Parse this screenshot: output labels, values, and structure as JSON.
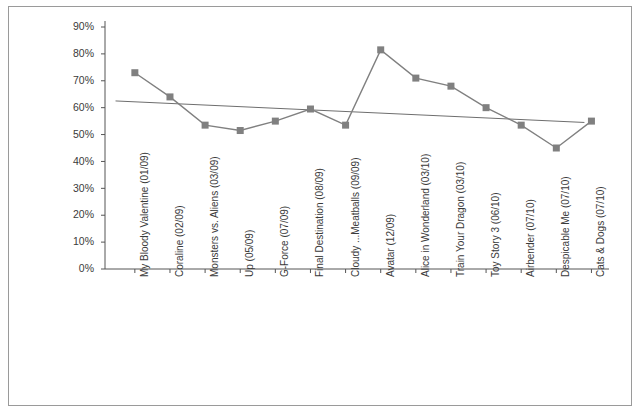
{
  "figure": {
    "border_color": "#9a9a9a",
    "background": "#ffffff"
  },
  "chart_data": {
    "type": "line",
    "title": "",
    "subtitle": "",
    "xlabel": "",
    "ylabel": "",
    "ylim": [
      0,
      90
    ],
    "ytick_labels": [
      "90%",
      "80%",
      "70%",
      "60%",
      "50%",
      "40%",
      "30%",
      "20%",
      "10%",
      "0%"
    ],
    "ytick_values": [
      90,
      80,
      70,
      60,
      50,
      40,
      30,
      20,
      10,
      0
    ],
    "grid": false,
    "legend": "none",
    "marker": "square",
    "series_color": "#808080",
    "trendline_color": "#6e6e6e",
    "categories": [
      "My Bloody Valentine (01/09)",
      "Coraline (02/09)",
      "Monsters vs. Aliens (03/09)",
      "Up (05/09)",
      "G-Force (07/09)",
      "Final Destination (08/09)",
      "Cloudy ...Meatballs (09/09)",
      "Avatar (12/09)",
      "Alice in Wonderland (03/10)",
      "Train Your Dragon (03/10)",
      "Toy Story 3 (06/10)",
      "Airbender (07/10)",
      "Despicable Me (07/10)",
      "Cats & Dogs (07/10)"
    ],
    "values": [
      73,
      64,
      53.5,
      51.5,
      55,
      59.5,
      53.5,
      81.5,
      71,
      68,
      60,
      53.5,
      45,
      55
    ],
    "series": [
      {
        "name": "3D share of opening weekend gross",
        "values": [
          73,
          64,
          53.5,
          51.5,
          55,
          59.5,
          53.5,
          81.5,
          71,
          68,
          60,
          53.5,
          45,
          55
        ]
      }
    ],
    "trendline": {
      "type": "linear",
      "start_value": 62.5,
      "end_value": 54.5,
      "start_category_index": 0,
      "end_category_index": 13
    }
  }
}
